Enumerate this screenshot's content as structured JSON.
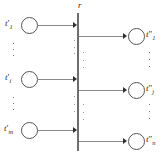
{
  "diagram": {
    "type": "petri-net-transition",
    "top_label": "r",
    "inputs": [
      {
        "base": "t",
        "prime": "′",
        "sub": "1",
        "label": "t′1"
      },
      {
        "base": "t",
        "prime": "′",
        "sub": "i",
        "label": "t′i"
      },
      {
        "base": "t",
        "prime": "′",
        "sub": "m",
        "label": "t′m"
      }
    ],
    "outputs": [
      {
        "base": "t",
        "prime": "″",
        "sub": "1",
        "label": "t″1"
      },
      {
        "base": "t",
        "prime": "″",
        "sub": "j",
        "label": "t″j"
      },
      {
        "base": "t",
        "prime": "″",
        "sub": "n",
        "label": "t″n"
      }
    ],
    "ellipsis_glyph": "⋮",
    "ellipsis_count": 6,
    "colors": {
      "node_stroke": "#555555",
      "edge": "#8a8a8a",
      "arrowhead": "#2f2f2f",
      "bar": "#6e6e6e",
      "text": "#2b2b2b",
      "background": "#ffffff"
    }
  }
}
